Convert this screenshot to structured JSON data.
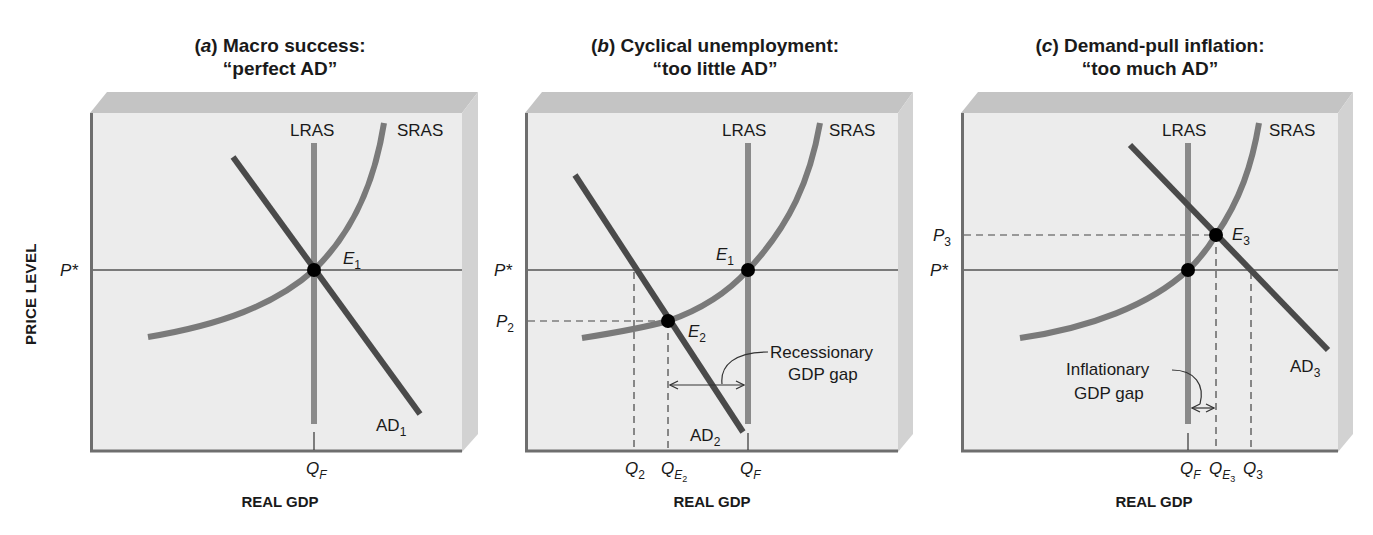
{
  "figure": {
    "y_axis_label": "PRICE LEVEL",
    "colors": {
      "background": "#ffffff",
      "plot_face": "#ececec",
      "plot_top_face": "#c4c4c4",
      "plot_side_face": "#cfcfcf",
      "axis": "#6e6e6e",
      "lras": "#8a8a8a",
      "sras": "#7a7a7a",
      "ad": "#4a4a4a",
      "equilibrium_point": "#000000",
      "text": "#1a1a1a"
    }
  },
  "panels": [
    {
      "id": "a",
      "letter": "a",
      "title_line1": "Macro success:",
      "title_line2": "“perfect AD”",
      "x_axis_label": "REAL GDP",
      "labels": {
        "lras": "LRAS",
        "sras": "SRAS",
        "ad_main": "AD",
        "ad_sub": "1",
        "eq_main": "E",
        "eq_sub": "1",
        "p_star": "P*",
        "qf_main": "Q",
        "qf_sub": "F"
      }
    },
    {
      "id": "b",
      "letter": "b",
      "title_line1": "Cyclical unemployment:",
      "title_line2": "“too little AD”",
      "x_axis_label": "REAL GDP",
      "labels": {
        "lras": "LRAS",
        "sras": "SRAS",
        "ad_main": "AD",
        "ad_sub": "2",
        "eq1_main": "E",
        "eq1_sub": "1",
        "eq2_main": "E",
        "eq2_sub": "2",
        "p_star": "P*",
        "p2_main": "P",
        "p2_sub": "2",
        "q2_main": "Q",
        "q2_sub": "2",
        "qe2_main": "Q",
        "qe2_sub": "E",
        "qe2_subsub": "2",
        "qf_main": "Q",
        "qf_sub": "F",
        "gap_line1": "Recessionary",
        "gap_line2": "GDP gap"
      }
    },
    {
      "id": "c",
      "letter": "c",
      "title_line1": "Demand-pull inflation:",
      "title_line2": "“too much AD”",
      "x_axis_label": "REAL GDP",
      "labels": {
        "lras": "LRAS",
        "sras": "SRAS",
        "ad_main": "AD",
        "ad_sub": "3",
        "eq3_main": "E",
        "eq3_sub": "3",
        "p3_main": "P",
        "p3_sub": "3",
        "p_star": "P*",
        "qf_main": "Q",
        "qf_sub": "F",
        "qe3_main": "Q",
        "qe3_sub": "E",
        "qe3_subsub": "3",
        "q3_main": "Q",
        "q3_sub": "3",
        "gap_line1": "Inflationary",
        "gap_line2": "GDP gap"
      }
    }
  ]
}
